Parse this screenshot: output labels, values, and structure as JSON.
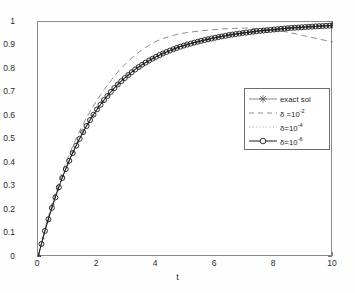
{
  "chart_data": {
    "type": "line",
    "title": "",
    "xlabel": "t",
    "ylabel": "",
    "xlim": [
      0,
      10
    ],
    "ylim": [
      0,
      1
    ],
    "xticks": [
      0,
      2,
      4,
      6,
      8,
      10
    ],
    "yticks": [
      0,
      0.1,
      0.2,
      0.3,
      0.4,
      0.5,
      0.6,
      0.7,
      0.8,
      0.9,
      1
    ],
    "xtick_labels": [
      "0",
      "2",
      "4",
      "6",
      "8",
      "10"
    ],
    "ytick_labels": [
      "0",
      "0.1",
      "0.2",
      "0.3",
      "0.4",
      "0.5",
      "0.6",
      "0.7",
      "0.8",
      "0.9",
      "1"
    ],
    "grid": false,
    "legend_position": "center-right",
    "x": [
      0,
      0.25,
      0.5,
      0.75,
      1,
      1.25,
      1.5,
      1.75,
      2,
      2.25,
      2.5,
      2.75,
      3,
      3.25,
      3.5,
      3.75,
      4,
      4.25,
      4.5,
      4.75,
      5,
      5.5,
      6,
      6.5,
      7,
      7.5,
      8,
      8.5,
      9,
      9.5,
      10
    ],
    "series": [
      {
        "name": "exact sol",
        "style": "solid-star",
        "color": "#555555",
        "values": [
          0,
          0.118,
          0.221,
          0.313,
          0.393,
          0.463,
          0.525,
          0.58,
          0.628,
          0.67,
          0.707,
          0.74,
          0.768,
          0.794,
          0.816,
          0.835,
          0.852,
          0.867,
          0.88,
          0.892,
          0.902,
          0.919,
          0.933,
          0.945,
          0.954,
          0.962,
          0.968,
          0.974,
          0.978,
          0.982,
          0.985
        ]
      },
      {
        "name": "delta = 10^-2",
        "style": "dashed",
        "color": "#808080",
        "values": [
          0,
          0.125,
          0.235,
          0.332,
          0.417,
          0.492,
          0.558,
          0.616,
          0.667,
          0.713,
          0.755,
          0.793,
          0.826,
          0.855,
          0.879,
          0.9,
          0.917,
          0.93,
          0.94,
          0.948,
          0.954,
          0.962,
          0.968,
          0.972,
          0.974,
          0.972,
          0.966,
          0.956,
          0.942,
          0.928,
          0.915
        ]
      },
      {
        "name": "delta = 10^-4",
        "style": "dotted",
        "color": "#a0a0a0",
        "values": [
          0,
          0.118,
          0.221,
          0.313,
          0.393,
          0.463,
          0.525,
          0.58,
          0.628,
          0.67,
          0.707,
          0.74,
          0.768,
          0.794,
          0.816,
          0.835,
          0.852,
          0.867,
          0.88,
          0.892,
          0.902,
          0.919,
          0.933,
          0.945,
          0.954,
          0.962,
          0.968,
          0.974,
          0.978,
          0.982,
          0.985
        ]
      },
      {
        "name": "delta = 10^-6",
        "style": "solid-circle",
        "color": "#1a1a1a",
        "values": [
          0,
          0.118,
          0.221,
          0.313,
          0.393,
          0.463,
          0.525,
          0.58,
          0.628,
          0.67,
          0.707,
          0.74,
          0.768,
          0.794,
          0.816,
          0.835,
          0.852,
          0.867,
          0.88,
          0.892,
          0.902,
          0.919,
          0.933,
          0.945,
          0.954,
          0.962,
          0.968,
          0.974,
          0.978,
          0.982,
          0.985
        ]
      }
    ]
  },
  "legend": {
    "entries": [
      {
        "label": "exact sol",
        "base": "exact sol",
        "sym": "",
        "exp": ""
      },
      {
        "label": "δ =10-2",
        "base": "δ =10",
        "sym": "δ =10",
        "exp": "-2"
      },
      {
        "label": "δ=10-4",
        "base": "δ=10",
        "sym": "δ=10",
        "exp": "-4"
      },
      {
        "label": "δ=10-6",
        "base": "δ=10",
        "sym": "δ=10",
        "exp": "-6"
      }
    ]
  },
  "axis": {
    "xlabel": "t",
    "xtick_labels": [
      "0",
      "2",
      "4",
      "6",
      "8",
      "10"
    ],
    "ytick_labels": [
      "1",
      "0.9",
      "0.8",
      "0.7",
      "0.6",
      "0.5",
      "0.4",
      "0.3",
      "0.2",
      "0.1",
      "0"
    ]
  }
}
